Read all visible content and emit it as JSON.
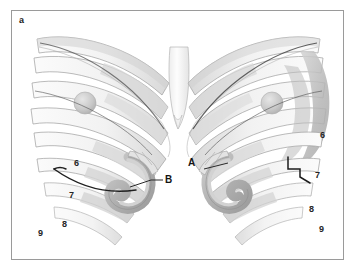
{
  "figure": {
    "panel_letter": "a",
    "border_color": "#9a9a9a",
    "background_color": "#ffffff"
  },
  "labels": {
    "left_side": [
      {
        "text": "6",
        "name": "rib-label-left-6"
      },
      {
        "text": "7",
        "name": "rib-label-left-7"
      },
      {
        "text": "8",
        "name": "rib-label-left-8"
      },
      {
        "text": "9",
        "name": "rib-label-left-9"
      }
    ],
    "right_side": [
      {
        "text": "6",
        "name": "rib-label-right-6"
      },
      {
        "text": "7",
        "name": "rib-label-right-7"
      },
      {
        "text": "8",
        "name": "rib-label-right-8"
      },
      {
        "text": "9",
        "name": "rib-label-right-9"
      }
    ],
    "callouts": [
      {
        "text": "A",
        "name": "callout-label-a",
        "leader": "line pointing right toward costal cartilage"
      },
      {
        "text": "B",
        "name": "callout-label-b",
        "leader": "line pointing left toward costal cartilage"
      }
    ]
  },
  "colors": {
    "bone_light": "#f4f4f4",
    "bone_mid": "#e2e2e2",
    "bone_shade": "#cfcfcf",
    "cartilage_dark": "#a8a8a8",
    "cartilage_mid": "#c2c2c2",
    "outline": "#8f8f8f",
    "dark_line": "#2b2b2b",
    "nodule": "#c9c9c9",
    "shadow_crescent": "#b5b5b5"
  }
}
